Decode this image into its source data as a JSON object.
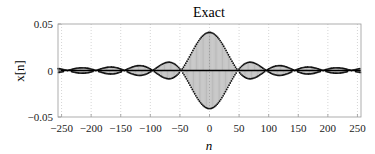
{
  "chart_data": {
    "type": "stem",
    "title": "Exact",
    "xlabel": "n",
    "ylabel": "x[n]",
    "xlim": [
      -256,
      256
    ],
    "ylim": [
      -0.05,
      0.05
    ],
    "xticks": [
      -250,
      -200,
      -150,
      -100,
      -50,
      0,
      50,
      100,
      150,
      200,
      250
    ],
    "xtick_labels": [
      "−250",
      "−200",
      "−150",
      "−100",
      "−50",
      "0",
      "50",
      "100",
      "150",
      "200",
      "250"
    ],
    "yticks": [
      -0.05,
      0,
      0.05
    ],
    "ytick_labels": [
      "−0.05",
      "0",
      "0.05"
    ],
    "grid": {
      "vertical": true,
      "horizontal": false,
      "style": "dotted"
    },
    "series": [
      {
        "name": "x[n]",
        "description": "sinc-enveloped signal with alternating-sign carrier; stems drawn for n = -256..255",
        "peak_amplitude": 0.041,
        "main_lobe_zero_crossings": [
          -47,
          47
        ],
        "side_lobe_centers": [
          -225,
          -175,
          -125,
          -75,
          75,
          125,
          175,
          225
        ],
        "side_lobe_amplitudes": [
          0.005,
          0.006,
          0.008,
          0.012,
          0.012,
          0.008,
          0.006,
          0.005
        ],
        "envelope_zero_spacing": 48,
        "n_range": [
          -256,
          255
        ]
      }
    ],
    "colors": {
      "stem": "#333333",
      "marker": "#111111",
      "axis": "#999999",
      "grid": "#bbbbbb",
      "baseline": "#000000"
    }
  }
}
